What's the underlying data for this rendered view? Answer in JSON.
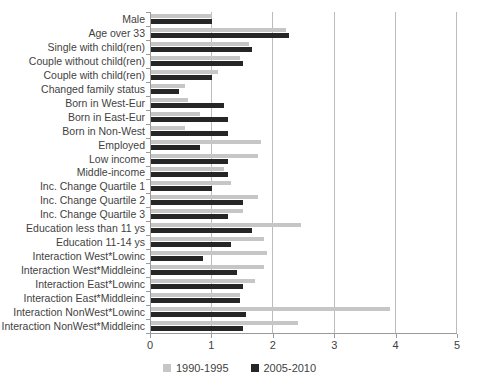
{
  "chart_data": {
    "type": "bar",
    "orientation": "horizontal",
    "title": "",
    "xlabel": "",
    "ylabel": "",
    "xlim": [
      0,
      5
    ],
    "x_ticks": [
      0,
      1,
      2,
      3,
      4,
      5
    ],
    "grid": "vertical",
    "legend_position": "bottom",
    "categories": [
      "Male",
      "Age over 33",
      "Single with child(ren)",
      "Couple without child(ren)",
      "Couple with child(ren)",
      "Changed family status",
      "Born in West-Eur",
      "Born in East-Eur",
      "Born in Non-West",
      "Employed",
      "Low income",
      "Middle-income",
      "Inc. Change Quartile 1",
      "Inc. Change Quartile 2",
      "Inc. Change Quartile 3",
      "Education less than 11 ys",
      "Education 11-14 ys",
      "Interaction West*Lowinc",
      "Interaction West*Middleinc",
      "Interaction East*Lowinc",
      "Interaction East*Middleinc",
      "Interaction NonWest*Lowinc",
      "Interaction NonWest*Middleinc"
    ],
    "series": [
      {
        "name": "1990-1995",
        "color": "#c6c6c6",
        "values": [
          1.0,
          2.2,
          1.6,
          1.45,
          1.1,
          0.55,
          0.6,
          0.8,
          0.55,
          1.8,
          1.75,
          1.2,
          1.3,
          1.75,
          1.5,
          2.45,
          1.85,
          1.9,
          1.85,
          1.7,
          1.45,
          3.9,
          2.4
        ]
      },
      {
        "name": "2005-2010",
        "color": "#262626",
        "values": [
          1.0,
          2.25,
          1.65,
          1.5,
          1.0,
          0.45,
          1.2,
          1.25,
          1.25,
          0.8,
          1.25,
          1.25,
          1.0,
          1.5,
          1.25,
          1.65,
          1.3,
          0.85,
          1.4,
          1.5,
          1.45,
          1.55,
          1.5
        ]
      }
    ]
  },
  "colors": {
    "gridline": "#bcbcbc",
    "axis_line": "#9b9b9b",
    "text": "#3f3f3f"
  }
}
